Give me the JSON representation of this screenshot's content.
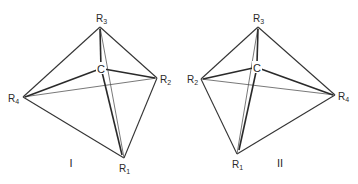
{
  "diagram": {
    "structures": [
      {
        "id": "I",
        "label": "I",
        "center": {
          "label": "C",
          "x": 101,
          "y": 68
        },
        "vertices": {
          "R1": {
            "label": "R",
            "sub": "1",
            "x": 124,
            "y": 158
          },
          "R2": {
            "label": "R",
            "sub": "2",
            "x": 157,
            "y": 78
          },
          "R3": {
            "label": "R",
            "sub": "3",
            "x": 100,
            "y": 27
          },
          "R4": {
            "label": "R",
            "sub": "4",
            "x": 23,
            "y": 97
          }
        }
      },
      {
        "id": "II",
        "label": "II",
        "center": {
          "label": "C",
          "x": 257,
          "y": 67
        },
        "vertices": {
          "R1": {
            "label": "R",
            "sub": "1",
            "x": 237,
            "y": 154
          },
          "R2": {
            "label": "R",
            "sub": "2",
            "x": 201,
            "y": 79
          },
          "R3": {
            "label": "R",
            "sub": "3",
            "x": 258,
            "y": 27
          },
          "R4": {
            "label": "R",
            "sub": "4",
            "x": 335,
            "y": 95
          }
        }
      }
    ]
  }
}
